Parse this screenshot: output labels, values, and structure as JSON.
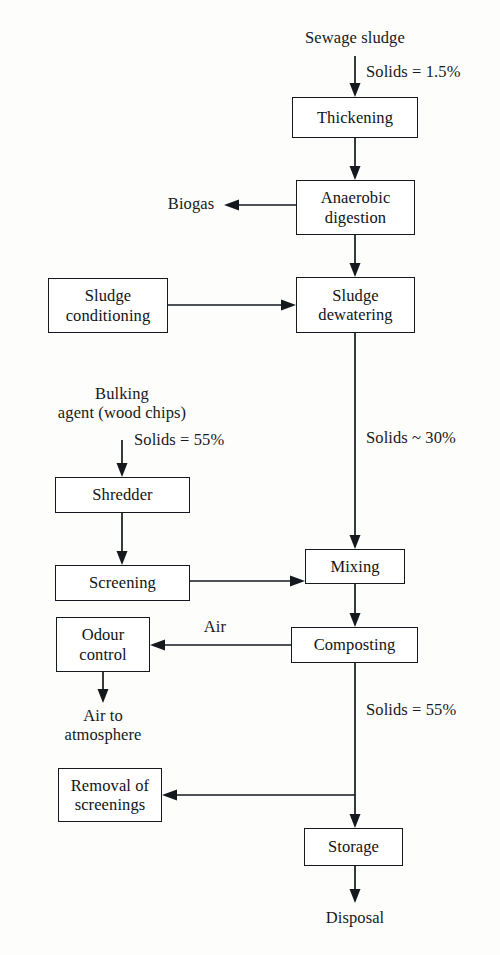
{
  "diagram": {
    "background_color": "#fdfdfb",
    "line_color": "#15181c",
    "text_color": "#17191d"
  },
  "boxes": {
    "thickening": "Thickening",
    "anaerobic_digestion": "Anaerobic\ndigestion",
    "sludge_conditioning": "Sludge\nconditioning",
    "sludge_dewatering": "Sludge\ndewatering",
    "shredder": "Shredder",
    "screening": "Screening",
    "mixing": "Mixing",
    "odour_control": "Odour\ncontrol",
    "composting": "Composting",
    "removal_of_screenings": "Removal of\nscreenings",
    "storage": "Storage"
  },
  "labels": {
    "sewage_sludge": "Sewage sludge",
    "solids_inlet": "Solids = 1.5%",
    "biogas": "Biogas",
    "bulking_agent": "Bulking\nagent (wood chips)",
    "solids_bulking": "Solids = 55%",
    "solids_dewatered": "Solids ~ 30%",
    "air": "Air",
    "air_to_atmosphere": "Air to\natmosphere",
    "solids_compost": "Solids = 55%",
    "disposal": "Disposal"
  },
  "flows": [
    {
      "from": "sewage-sludge",
      "to": "thickening",
      "label": "Solids = 1.5%"
    },
    {
      "from": "thickening",
      "to": "anaerobic-digestion",
      "label": ""
    },
    {
      "from": "anaerobic-digestion",
      "to": "biogas",
      "label": "Biogas"
    },
    {
      "from": "anaerobic-digestion",
      "to": "sludge-dewatering",
      "label": ""
    },
    {
      "from": "sludge-conditioning",
      "to": "sludge-dewatering",
      "label": ""
    },
    {
      "from": "sludge-dewatering",
      "to": "mixing",
      "label": "Solids ~ 30%"
    },
    {
      "from": "bulking-agent",
      "to": "shredder",
      "label": "Solids = 55%"
    },
    {
      "from": "shredder",
      "to": "screening",
      "label": ""
    },
    {
      "from": "screening",
      "to": "mixing",
      "label": ""
    },
    {
      "from": "mixing",
      "to": "composting",
      "label": ""
    },
    {
      "from": "composting",
      "to": "odour-control",
      "label": "Air"
    },
    {
      "from": "odour-control",
      "to": "air-to-atmosphere",
      "label": ""
    },
    {
      "from": "composting",
      "to": "removal-of-screenings",
      "label": "Solids = 55%"
    },
    {
      "from": "composting",
      "to": "storage",
      "label": ""
    },
    {
      "from": "storage",
      "to": "disposal",
      "label": ""
    }
  ]
}
